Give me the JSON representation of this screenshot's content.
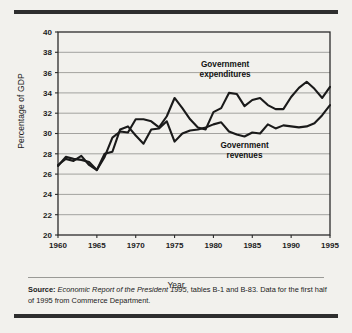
{
  "figure": {
    "background_color": "#f2f1ed",
    "rule_color": "#2e2e2e",
    "line_color": "#1a1a1a",
    "grid_color": "#8e8e8a",
    "axis_color": "#2b2b2b"
  },
  "source_note": {
    "label": "Source:",
    "italic_title": "Economic Report of the President 1995",
    "rest": ", tables B-1 and B-83. Data for the first half of 1995 from Commerce Department."
  },
  "chart_data": {
    "type": "line",
    "title": "",
    "xlabel": "Year",
    "ylabel": "Percentage of GDP",
    "xlim": [
      1960,
      1995
    ],
    "ylim": [
      20,
      40
    ],
    "xticks": [
      1960,
      1965,
      1970,
      1975,
      1980,
      1985,
      1990,
      1995
    ],
    "yticks": [
      20,
      22,
      24,
      26,
      28,
      30,
      32,
      34,
      36,
      38,
      40
    ],
    "grid": "horizontal",
    "legend_position": "inline-annotations",
    "annotations": [
      {
        "text": "Government expenditures",
        "line1": "Government",
        "line2": "expenditures",
        "x": 1981.5,
        "y": 36.6
      },
      {
        "text": "Government revenues",
        "line1": "Government",
        "line2": "revenues",
        "x": 1984.0,
        "y": 28.6
      }
    ],
    "x": [
      1960,
      1961,
      1962,
      1963,
      1964,
      1965,
      1966,
      1967,
      1968,
      1969,
      1970,
      1971,
      1972,
      1973,
      1974,
      1975,
      1976,
      1977,
      1978,
      1979,
      1980,
      1981,
      1982,
      1983,
      1984,
      1985,
      1986,
      1987,
      1988,
      1989,
      1990,
      1991,
      1992,
      1993,
      1994,
      1995
    ],
    "series": [
      {
        "name": "Government expenditures",
        "values": [
          26.8,
          27.7,
          27.5,
          27.4,
          27.2,
          26.4,
          27.7,
          29.6,
          30.2,
          30.1,
          31.4,
          31.4,
          31.2,
          30.6,
          31.7,
          33.5,
          32.5,
          31.4,
          30.6,
          30.4,
          32.1,
          32.5,
          34.0,
          33.9,
          32.7,
          33.3,
          33.5,
          32.8,
          32.4,
          32.4,
          33.6,
          34.5,
          35.1,
          34.4,
          33.5,
          34.6
        ]
      },
      {
        "name": "Government revenues",
        "values": [
          26.9,
          27.5,
          27.3,
          27.8,
          26.9,
          26.4,
          28.0,
          28.2,
          30.4,
          30.7,
          29.8,
          29.0,
          30.4,
          30.5,
          31.2,
          29.2,
          30.0,
          30.3,
          30.4,
          30.6,
          30.9,
          31.1,
          30.2,
          29.9,
          29.7,
          30.1,
          30.0,
          30.9,
          30.5,
          30.8,
          30.7,
          30.6,
          30.7,
          31.0,
          31.8,
          32.8
        ]
      }
    ]
  }
}
